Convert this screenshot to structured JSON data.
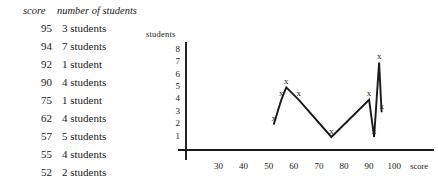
{
  "table": {
    "headers": {
      "score": "score",
      "count": "number of students"
    },
    "rows": [
      {
        "score": "95",
        "count": "3 students"
      },
      {
        "score": "94",
        "count": "7 students"
      },
      {
        "score": "92",
        "count": "1 student"
      },
      {
        "score": "90",
        "count": "4 students"
      },
      {
        "score": "75",
        "count": "1 student"
      },
      {
        "score": "62",
        "count": "4 students"
      },
      {
        "score": "57",
        "count": "5 students"
      },
      {
        "score": "55",
        "count": "4 students"
      },
      {
        "score": "52",
        "count": "2 students"
      }
    ]
  },
  "chart_data": {
    "type": "line",
    "title": "",
    "xlabel": "score",
    "ylabel": "students",
    "marker": "x",
    "grid": false,
    "legend": null,
    "xlim": [
      20,
      105
    ],
    "ylim": [
      0,
      8
    ],
    "xticks": [
      "30",
      "40",
      "50",
      "60",
      "70",
      "80",
      "90",
      "100"
    ],
    "xtick_values": [
      30,
      40,
      50,
      60,
      70,
      80,
      90,
      100
    ],
    "yticks": [
      "1",
      "2",
      "3",
      "4",
      "5",
      "6",
      "7",
      "8"
    ],
    "ytick_values": [
      1,
      2,
      3,
      4,
      5,
      6,
      7,
      8
    ],
    "x": [
      52,
      55,
      57,
      62,
      75,
      90,
      92,
      94,
      95
    ],
    "values": [
      2,
      4,
      5,
      4,
      1,
      4,
      1,
      7,
      3
    ],
    "points": [
      {
        "x": 52,
        "y": 2
      },
      {
        "x": 55,
        "y": 4
      },
      {
        "x": 57,
        "y": 5
      },
      {
        "x": 62,
        "y": 4
      },
      {
        "x": 75,
        "y": 1
      },
      {
        "x": 90,
        "y": 4
      },
      {
        "x": 92,
        "y": 1
      },
      {
        "x": 94,
        "y": 7
      },
      {
        "x": 95,
        "y": 3
      }
    ],
    "axis_color": "#1a1a1a",
    "line_color": "#1a1a1a"
  }
}
